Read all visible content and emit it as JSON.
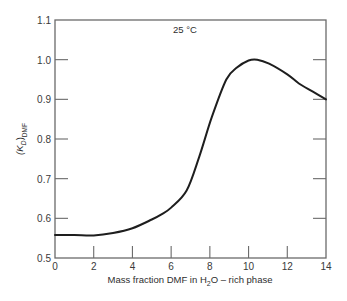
{
  "chart_data": {
    "type": "line",
    "title": "",
    "annotation": "25 °C",
    "xlabel": "Mass fraction DMF in H2O – rich phase",
    "xlabel_parts": {
      "pre": "Mass fraction DMF in H",
      "sub": "2",
      "post": "O – rich phase"
    },
    "ylabel": "(K_D)_DMF",
    "ylabel_parts": {
      "open": "(K",
      "sub1": "D",
      "close": ")",
      "sub2": "DMF"
    },
    "xlim": [
      0,
      14
    ],
    "ylim": [
      0.5,
      1.1
    ],
    "xticks": [
      0,
      2,
      4,
      6,
      8,
      10,
      12,
      14
    ],
    "xtick_labels": [
      "0",
      "2",
      "4",
      "6",
      "8",
      "10",
      "12",
      "14"
    ],
    "yticks": [
      0.5,
      0.6,
      0.7,
      0.8,
      0.9,
      1.0,
      1.1
    ],
    "ytick_labels": [
      "0.5",
      "0.6",
      "0.7",
      "0.8",
      "0.9",
      "1.0",
      "1.1"
    ],
    "grid": false,
    "legend": null,
    "series": [
      {
        "name": "(K_D)_DMF at 25 °C",
        "x": [
          0,
          1,
          2,
          3,
          4,
          5,
          5.5,
          6,
          6.8,
          7.45,
          8.1,
          8.85,
          9.4,
          10.0,
          10.45,
          11.06,
          12.0,
          12.6,
          13.3,
          14.0
        ],
        "y": [
          0.558,
          0.558,
          0.557,
          0.563,
          0.575,
          0.597,
          0.61,
          0.627,
          0.67,
          0.755,
          0.855,
          0.95,
          0.98,
          0.998,
          1.0,
          0.99,
          0.963,
          0.94,
          0.92,
          0.9
        ]
      }
    ]
  }
}
